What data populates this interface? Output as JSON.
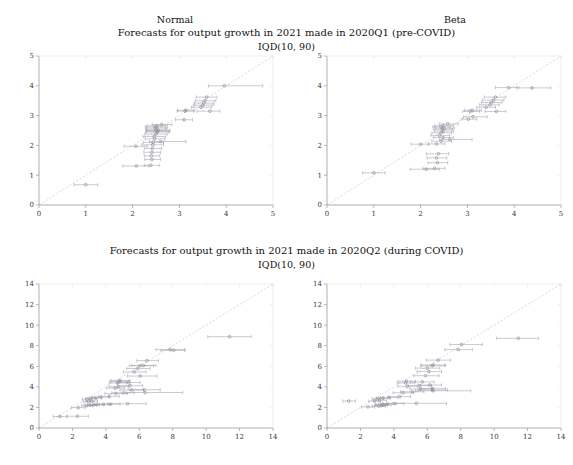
{
  "figure": {
    "width": 573,
    "height": 465,
    "background": "#ffffff",
    "axis_color": "#9a9a9a",
    "text_color": "#111111",
    "marker_color": "#8d8d9b",
    "errorbar_color": "#9e9eab",
    "refline_color": "#c9c9d4"
  },
  "column_headers": [
    {
      "label": "Normal",
      "x": 175,
      "y": 22
    },
    {
      "label": "Beta",
      "x": 455,
      "y": 22
    }
  ],
  "rows": [
    {
      "title": "Forecasts for output growth in 2021 made in 2020Q1 (pre-COVID)",
      "subtitle": "IQD(10, 90)",
      "title_y": 33,
      "subtitle_y": 46
    },
    {
      "title": "Forecasts for output growth in 2021 made in 2020Q2 (during COVID)",
      "subtitle": "IQD(10, 90)",
      "title_y": 251,
      "subtitle_y": 264
    }
  ],
  "chart_data": [
    {
      "type": "scatter",
      "panel": "top-left",
      "distribution": "Normal",
      "period": "2020Q1 (pre-COVID)",
      "title": "Forecasts for output growth in 2021 made in 2020Q1 (pre-COVID)",
      "subtitle": "IQD(10, 90)",
      "xlabel": "",
      "ylabel": "",
      "xlim": [
        0,
        5
      ],
      "ylim": [
        0,
        5
      ],
      "xticks": [
        0,
        1,
        2,
        3,
        4,
        5
      ],
      "yticks": [
        0,
        1,
        2,
        3,
        4,
        5
      ],
      "grid": false,
      "reference_line": {
        "type": "identity",
        "from": [
          0,
          0
        ],
        "to": [
          5,
          5
        ]
      },
      "error_bar_orientation": "horizontal",
      "points": [
        {
          "x": 1.0,
          "y": 0.68,
          "xlo": 0.75,
          "xhi": 1.25
        },
        {
          "x": 2.08,
          "y": 1.31,
          "xlo": 1.79,
          "xhi": 2.35
        },
        {
          "x": 2.39,
          "y": 1.33,
          "xlo": 2.25,
          "xhi": 2.57
        },
        {
          "x": 2.41,
          "y": 1.53,
          "xlo": 2.26,
          "xhi": 2.6
        },
        {
          "x": 2.4,
          "y": 1.65,
          "xlo": 2.25,
          "xhi": 2.58
        },
        {
          "x": 2.41,
          "y": 1.77,
          "xlo": 2.24,
          "xhi": 2.6
        },
        {
          "x": 2.42,
          "y": 1.9,
          "xlo": 2.25,
          "xhi": 2.62
        },
        {
          "x": 2.07,
          "y": 1.97,
          "xlo": 1.82,
          "xhi": 2.31
        },
        {
          "x": 2.43,
          "y": 2.02,
          "xlo": 2.2,
          "xhi": 2.66
        },
        {
          "x": 2.44,
          "y": 2.1,
          "xlo": 2.23,
          "xhi": 2.66
        },
        {
          "x": 2.6,
          "y": 2.13,
          "xlo": 2.36,
          "xhi": 3.14
        },
        {
          "x": 2.47,
          "y": 2.22,
          "xlo": 2.27,
          "xhi": 2.69
        },
        {
          "x": 2.46,
          "y": 2.3,
          "xlo": 2.22,
          "xhi": 2.7
        },
        {
          "x": 2.5,
          "y": 2.38,
          "xlo": 2.26,
          "xhi": 2.74
        },
        {
          "x": 2.52,
          "y": 2.45,
          "xlo": 2.28,
          "xhi": 2.77
        },
        {
          "x": 2.53,
          "y": 2.47,
          "xlo": 2.3,
          "xhi": 2.79
        },
        {
          "x": 2.55,
          "y": 2.5,
          "xlo": 2.3,
          "xhi": 2.8
        },
        {
          "x": 2.49,
          "y": 2.53,
          "xlo": 2.28,
          "xhi": 2.72
        },
        {
          "x": 2.51,
          "y": 2.58,
          "xlo": 2.3,
          "xhi": 2.74
        },
        {
          "x": 2.48,
          "y": 2.62,
          "xlo": 2.27,
          "xhi": 2.7
        },
        {
          "x": 2.52,
          "y": 2.66,
          "xlo": 2.31,
          "xhi": 2.74
        },
        {
          "x": 2.62,
          "y": 2.7,
          "xlo": 2.42,
          "xhi": 2.84
        },
        {
          "x": 3.1,
          "y": 2.86,
          "xlo": 2.92,
          "xhi": 3.28
        },
        {
          "x": 3.12,
          "y": 3.15,
          "xlo": 2.95,
          "xhi": 3.3
        },
        {
          "x": 3.14,
          "y": 3.18,
          "xlo": 2.96,
          "xhi": 3.33
        },
        {
          "x": 3.65,
          "y": 3.15,
          "xlo": 3.38,
          "xhi": 3.86
        },
        {
          "x": 3.46,
          "y": 3.28,
          "xlo": 3.26,
          "xhi": 3.68
        },
        {
          "x": 3.5,
          "y": 3.35,
          "xlo": 3.3,
          "xhi": 3.72
        },
        {
          "x": 3.52,
          "y": 3.42,
          "xlo": 3.32,
          "xhi": 3.74
        },
        {
          "x": 3.55,
          "y": 3.5,
          "xlo": 3.34,
          "xhi": 3.78
        },
        {
          "x": 3.58,
          "y": 3.62,
          "xlo": 3.36,
          "xhi": 3.8
        },
        {
          "x": 3.96,
          "y": 4.0,
          "xlo": 3.62,
          "xhi": 4.78
        }
      ]
    },
    {
      "type": "scatter",
      "panel": "top-right",
      "distribution": "Beta",
      "period": "2020Q1 (pre-COVID)",
      "title": "Forecasts for output growth in 2021 made in 2020Q1 (pre-COVID)",
      "subtitle": "IQD(10, 90)",
      "xlabel": "",
      "ylabel": "",
      "xlim": [
        0,
        5
      ],
      "ylim": [
        0,
        5
      ],
      "xticks": [
        0,
        1,
        2,
        3,
        4,
        5
      ],
      "yticks": [
        0,
        1,
        2,
        3,
        4,
        5
      ],
      "grid": false,
      "reference_line": {
        "type": "identity",
        "from": [
          0,
          0
        ],
        "to": [
          5,
          5
        ]
      },
      "error_bar_orientation": "horizontal",
      "points": [
        {
          "x": 1.0,
          "y": 1.08,
          "xlo": 0.76,
          "xhi": 1.24
        },
        {
          "x": 2.12,
          "y": 1.2,
          "xlo": 1.78,
          "xhi": 2.4
        },
        {
          "x": 2.3,
          "y": 1.23,
          "xlo": 2.05,
          "xhi": 2.52
        },
        {
          "x": 2.36,
          "y": 1.42,
          "xlo": 2.16,
          "xhi": 2.58
        },
        {
          "x": 2.34,
          "y": 1.58,
          "xlo": 2.14,
          "xhi": 2.56
        },
        {
          "x": 2.38,
          "y": 1.72,
          "xlo": 2.12,
          "xhi": 2.6
        },
        {
          "x": 2.0,
          "y": 2.04,
          "xlo": 1.8,
          "xhi": 2.18
        },
        {
          "x": 2.34,
          "y": 2.05,
          "xlo": 2.16,
          "xhi": 2.52
        },
        {
          "x": 2.44,
          "y": 2.14,
          "xlo": 2.24,
          "xhi": 2.66
        },
        {
          "x": 2.62,
          "y": 2.2,
          "xlo": 2.4,
          "xhi": 3.1
        },
        {
          "x": 2.48,
          "y": 2.26,
          "xlo": 2.28,
          "xhi": 2.7
        },
        {
          "x": 2.4,
          "y": 2.33,
          "xlo": 2.22,
          "xhi": 2.62
        },
        {
          "x": 2.44,
          "y": 2.42,
          "xlo": 2.24,
          "xhi": 2.66
        },
        {
          "x": 2.48,
          "y": 2.48,
          "xlo": 2.3,
          "xhi": 2.7
        },
        {
          "x": 2.46,
          "y": 2.54,
          "xlo": 2.28,
          "xhi": 2.68
        },
        {
          "x": 2.5,
          "y": 2.58,
          "xlo": 2.32,
          "xhi": 2.72
        },
        {
          "x": 2.44,
          "y": 2.62,
          "xlo": 2.26,
          "xhi": 2.64
        },
        {
          "x": 2.48,
          "y": 2.66,
          "xlo": 2.3,
          "xhi": 2.7
        },
        {
          "x": 2.58,
          "y": 2.72,
          "xlo": 2.4,
          "xhi": 2.8
        },
        {
          "x": 3.02,
          "y": 2.88,
          "xlo": 2.88,
          "xhi": 3.2
        },
        {
          "x": 3.12,
          "y": 2.96,
          "xlo": 2.92,
          "xhi": 3.42
        },
        {
          "x": 3.06,
          "y": 3.14,
          "xlo": 2.9,
          "xhi": 3.26
        },
        {
          "x": 3.1,
          "y": 3.18,
          "xlo": 2.94,
          "xhi": 3.3
        },
        {
          "x": 3.62,
          "y": 3.14,
          "xlo": 3.38,
          "xhi": 3.82
        },
        {
          "x": 3.4,
          "y": 3.28,
          "xlo": 3.2,
          "xhi": 3.6
        },
        {
          "x": 3.48,
          "y": 3.36,
          "xlo": 3.26,
          "xhi": 3.68
        },
        {
          "x": 3.52,
          "y": 3.44,
          "xlo": 3.3,
          "xhi": 3.74
        },
        {
          "x": 3.56,
          "y": 3.52,
          "xlo": 3.32,
          "xhi": 3.78
        },
        {
          "x": 3.6,
          "y": 3.62,
          "xlo": 3.36,
          "xhi": 3.82
        },
        {
          "x": 3.88,
          "y": 3.94,
          "xlo": 3.6,
          "xhi": 4.1
        },
        {
          "x": 4.38,
          "y": 3.93,
          "xlo": 4.05,
          "xhi": 4.78
        }
      ]
    },
    {
      "type": "scatter",
      "panel": "bottom-left",
      "distribution": "Normal",
      "period": "2020Q2 (during COVID)",
      "title": "Forecasts for output growth in 2021 made in 2020Q2 (during COVID)",
      "subtitle": "IQD(10, 90)",
      "xlabel": "",
      "ylabel": "",
      "xlim": [
        0,
        14
      ],
      "ylim": [
        0,
        14
      ],
      "xticks": [
        0,
        2,
        4,
        6,
        8,
        10,
        12,
        14
      ],
      "yticks": [
        0,
        2,
        4,
        6,
        8,
        10,
        12,
        14
      ],
      "grid": false,
      "reference_line": {
        "type": "identity",
        "from": [
          0,
          0
        ],
        "to": [
          14,
          14
        ]
      },
      "error_bar_orientation": "horizontal",
      "points": [
        {
          "x": 1.25,
          "y": 1.12,
          "xlo": 0.85,
          "xhi": 1.65
        },
        {
          "x": 2.3,
          "y": 1.14,
          "xlo": 1.7,
          "xhi": 2.95
        },
        {
          "x": 2.35,
          "y": 1.98,
          "xlo": 1.95,
          "xhi": 2.75
        },
        {
          "x": 2.85,
          "y": 2.16,
          "xlo": 2.55,
          "xhi": 3.2
        },
        {
          "x": 3.05,
          "y": 2.22,
          "xlo": 2.7,
          "xhi": 3.45
        },
        {
          "x": 3.25,
          "y": 2.24,
          "xlo": 2.9,
          "xhi": 3.6
        },
        {
          "x": 3.45,
          "y": 2.28,
          "xlo": 3.05,
          "xhi": 3.9
        },
        {
          "x": 3.85,
          "y": 2.3,
          "xlo": 3.3,
          "xhi": 4.35
        },
        {
          "x": 4.25,
          "y": 2.32,
          "xlo": 3.6,
          "xhi": 4.85
        },
        {
          "x": 5.3,
          "y": 2.36,
          "xlo": 4.1,
          "xhi": 6.4
        },
        {
          "x": 2.95,
          "y": 2.56,
          "xlo": 2.65,
          "xhi": 3.3
        },
        {
          "x": 3.15,
          "y": 2.62,
          "xlo": 2.8,
          "xhi": 3.5
        },
        {
          "x": 2.88,
          "y": 2.8,
          "xlo": 2.6,
          "xhi": 3.15
        },
        {
          "x": 3.1,
          "y": 2.86,
          "xlo": 2.8,
          "xhi": 3.45
        },
        {
          "x": 3.35,
          "y": 2.92,
          "xlo": 3.0,
          "xhi": 3.75
        },
        {
          "x": 3.7,
          "y": 3.0,
          "xlo": 3.2,
          "xhi": 4.2
        },
        {
          "x": 4.2,
          "y": 3.08,
          "xlo": 3.55,
          "xhi": 4.8
        },
        {
          "x": 4.6,
          "y": 3.35,
          "xlo": 3.95,
          "xhi": 5.3
        },
        {
          "x": 5.05,
          "y": 3.42,
          "xlo": 4.35,
          "xhi": 5.7
        },
        {
          "x": 6.35,
          "y": 3.45,
          "xlo": 5.2,
          "xhi": 8.6
        },
        {
          "x": 5.55,
          "y": 3.7,
          "xlo": 4.85,
          "xhi": 6.25
        },
        {
          "x": 6.3,
          "y": 3.72,
          "xlo": 5.4,
          "xhi": 7.25
        },
        {
          "x": 4.55,
          "y": 3.88,
          "xlo": 4.05,
          "xhi": 5.1
        },
        {
          "x": 4.75,
          "y": 4.02,
          "xlo": 4.2,
          "xhi": 5.35
        },
        {
          "x": 5.45,
          "y": 4.12,
          "xlo": 4.7,
          "xhi": 6.2
        },
        {
          "x": 4.7,
          "y": 4.38,
          "xlo": 4.2,
          "xhi": 5.25
        },
        {
          "x": 5.35,
          "y": 4.42,
          "xlo": 4.7,
          "xhi": 6.05
        },
        {
          "x": 4.8,
          "y": 4.52,
          "xlo": 4.25,
          "xhi": 5.4
        },
        {
          "x": 4.85,
          "y": 4.62,
          "xlo": 4.3,
          "xhi": 5.45
        },
        {
          "x": 6.05,
          "y": 5.05,
          "xlo": 5.3,
          "xhi": 7.05
        },
        {
          "x": 5.7,
          "y": 5.45,
          "xlo": 5.05,
          "xhi": 6.4
        },
        {
          "x": 5.9,
          "y": 5.78,
          "xlo": 5.25,
          "xhi": 6.65
        },
        {
          "x": 6.05,
          "y": 6.05,
          "xlo": 5.4,
          "xhi": 6.85
        },
        {
          "x": 6.25,
          "y": 6.08,
          "xlo": 5.55,
          "xhi": 7.0
        },
        {
          "x": 6.45,
          "y": 6.55,
          "xlo": 5.85,
          "xhi": 7.15
        },
        {
          "x": 7.85,
          "y": 7.62,
          "xlo": 7.0,
          "xhi": 8.7
        },
        {
          "x": 8.05,
          "y": 7.55,
          "xlo": 7.3,
          "xhi": 8.75
        },
        {
          "x": 11.4,
          "y": 8.88,
          "xlo": 10.1,
          "xhi": 12.7
        }
      ]
    },
    {
      "type": "scatter",
      "panel": "bottom-right",
      "distribution": "Beta",
      "period": "2020Q2 (during COVID)",
      "title": "Forecasts for output growth in 2021 made in 2020Q2 (during COVID)",
      "subtitle": "IQD(10, 90)",
      "xlabel": "",
      "ylabel": "",
      "xlim": [
        0,
        14
      ],
      "ylim": [
        0,
        14
      ],
      "xticks": [
        0,
        2,
        4,
        6,
        8,
        10,
        12,
        14
      ],
      "yticks": [
        0,
        2,
        4,
        6,
        8,
        10,
        12,
        14
      ],
      "grid": false,
      "reference_line": {
        "type": "identity",
        "from": [
          0,
          0
        ],
        "to": [
          14,
          14
        ]
      },
      "error_bar_orientation": "horizontal",
      "points": [
        {
          "x": 2.45,
          "y": 2.05,
          "xlo": 2.05,
          "xhi": 2.85
        },
        {
          "x": 3.1,
          "y": 2.12,
          "xlo": 2.7,
          "xhi": 3.5
        },
        {
          "x": 3.25,
          "y": 2.18,
          "xlo": 2.85,
          "xhi": 3.6
        },
        {
          "x": 3.4,
          "y": 2.24,
          "xlo": 2.95,
          "xhi": 3.85
        },
        {
          "x": 3.3,
          "y": 2.3,
          "xlo": 2.9,
          "xhi": 3.7
        },
        {
          "x": 3.6,
          "y": 2.34,
          "xlo": 3.1,
          "xhi": 4.1
        },
        {
          "x": 4.0,
          "y": 2.38,
          "xlo": 3.35,
          "xhi": 4.6
        },
        {
          "x": 5.35,
          "y": 2.4,
          "xlo": 4.15,
          "xhi": 7.15
        },
        {
          "x": 1.3,
          "y": 2.62,
          "xlo": 0.95,
          "xhi": 1.7
        },
        {
          "x": 2.85,
          "y": 2.62,
          "xlo": 2.5,
          "xhi": 3.2
        },
        {
          "x": 3.15,
          "y": 2.7,
          "xlo": 2.8,
          "xhi": 3.55
        },
        {
          "x": 3.05,
          "y": 2.84,
          "xlo": 2.7,
          "xhi": 3.4
        },
        {
          "x": 3.35,
          "y": 2.92,
          "xlo": 2.95,
          "xhi": 3.8
        },
        {
          "x": 3.7,
          "y": 2.96,
          "xlo": 3.2,
          "xhi": 4.25
        },
        {
          "x": 4.35,
          "y": 3.05,
          "xlo": 3.7,
          "xhi": 5.0
        },
        {
          "x": 4.55,
          "y": 3.42,
          "xlo": 3.95,
          "xhi": 5.2
        },
        {
          "x": 5.1,
          "y": 3.52,
          "xlo": 4.4,
          "xhi": 5.8
        },
        {
          "x": 6.35,
          "y": 3.62,
          "xlo": 5.3,
          "xhi": 8.6
        },
        {
          "x": 6.3,
          "y": 3.7,
          "xlo": 5.45,
          "xhi": 7.2
        },
        {
          "x": 5.6,
          "y": 3.8,
          "xlo": 4.95,
          "xhi": 6.3
        },
        {
          "x": 6.3,
          "y": 3.85,
          "xlo": 5.55,
          "xhi": 7.1
        },
        {
          "x": 4.8,
          "y": 4.05,
          "xlo": 4.25,
          "xhi": 5.4
        },
        {
          "x": 5.55,
          "y": 4.12,
          "xlo": 4.85,
          "xhi": 6.25
        },
        {
          "x": 6.15,
          "y": 4.18,
          "xlo": 5.45,
          "xhi": 6.85
        },
        {
          "x": 4.7,
          "y": 4.38,
          "xlo": 4.2,
          "xhi": 5.25
        },
        {
          "x": 5.7,
          "y": 4.48,
          "xlo": 5.0,
          "xhi": 6.4
        },
        {
          "x": 4.75,
          "y": 4.55,
          "xlo": 4.25,
          "xhi": 5.3
        },
        {
          "x": 5.9,
          "y": 5.08,
          "xlo": 5.2,
          "xhi": 6.7
        },
        {
          "x": 6.1,
          "y": 5.48,
          "xlo": 5.4,
          "xhi": 6.85
        },
        {
          "x": 6.0,
          "y": 5.82,
          "xlo": 5.3,
          "xhi": 6.75
        },
        {
          "x": 6.3,
          "y": 6.05,
          "xlo": 5.6,
          "xhi": 7.05
        },
        {
          "x": 6.35,
          "y": 6.12,
          "xlo": 5.65,
          "xhi": 7.1
        },
        {
          "x": 6.65,
          "y": 6.6,
          "xlo": 5.95,
          "xhi": 7.4
        },
        {
          "x": 7.85,
          "y": 7.62,
          "xlo": 7.05,
          "xhi": 8.7
        },
        {
          "x": 8.05,
          "y": 8.12,
          "xlo": 7.35,
          "xhi": 9.3
        },
        {
          "x": 11.45,
          "y": 8.72,
          "xlo": 10.15,
          "xhi": 12.65
        }
      ]
    }
  ],
  "panel_layout": [
    {
      "name": "top-left",
      "left": 25,
      "top": 54,
      "width": 250,
      "height": 165
    },
    {
      "name": "top-right",
      "left": 313,
      "top": 54,
      "width": 250,
      "height": 165
    },
    {
      "name": "bottom-left",
      "left": 25,
      "top": 282,
      "width": 250,
      "height": 160
    },
    {
      "name": "bottom-right",
      "left": 313,
      "top": 282,
      "width": 250,
      "height": 160
    }
  ]
}
